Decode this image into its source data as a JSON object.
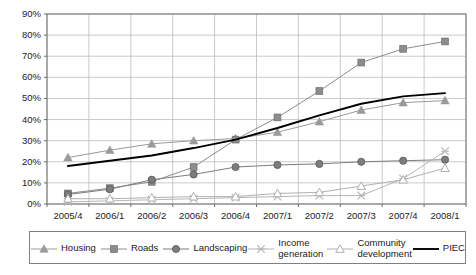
{
  "chart_data": {
    "type": "line",
    "title": "",
    "subtitle": "",
    "xlabel": "",
    "ylabel": "",
    "grid": true,
    "legend_position": "bottom",
    "ylim": [
      0,
      90
    ],
    "y_tick_labels": [
      "90%",
      "80%",
      "70%",
      "60%",
      "50%",
      "40%",
      "30%",
      "20%",
      "10%",
      "0%"
    ],
    "y_tick_values": [
      90,
      80,
      70,
      60,
      50,
      40,
      30,
      20,
      10,
      0
    ],
    "categories": [
      "2005/4",
      "2006/1",
      "2006/2",
      "2006/3",
      "2006/4",
      "2007/1",
      "2007/2",
      "2007/3",
      "2007/4",
      "2008/1"
    ],
    "series": [
      {
        "name": "Housing",
        "marker": "filled-triangle",
        "color": "#9a9a9a",
        "values": [
          22,
          25.5,
          28.5,
          30,
          31,
          34,
          39,
          44.5,
          48,
          49
        ]
      },
      {
        "name": "Roads",
        "marker": "filled-square",
        "color": "#8c8c8c",
        "values": [
          5,
          7.5,
          10.5,
          17.5,
          30.5,
          41,
          53.5,
          67,
          73.5,
          77
        ]
      },
      {
        "name": "Landscaping",
        "marker": "filled-circle",
        "color": "#7d7d7d",
        "values": [
          4.5,
          7,
          11.5,
          14,
          17.5,
          18.5,
          19,
          20,
          20.5,
          21
        ]
      },
      {
        "name": "Income generation",
        "marker": "cross-star",
        "color": "#b5b5b5",
        "values": [
          1,
          1.5,
          2,
          2.5,
          3,
          3.5,
          4,
          4,
          12,
          25
        ]
      },
      {
        "name": "Community development",
        "marker": "open-triangle",
        "color": "#b0b0b0",
        "values": [
          2.5,
          2.5,
          3,
          3.5,
          3.5,
          5,
          5.5,
          8.5,
          11.5,
          17
        ]
      },
      {
        "name": "PIEC",
        "marker": "none",
        "color": "#000000",
        "values": [
          18,
          20.5,
          23,
          26.5,
          30.5,
          36,
          42,
          47.5,
          51,
          52.5
        ]
      }
    ]
  },
  "legend": {
    "items": [
      {
        "label": "Housing",
        "marker_name": "filled-triangle-marker"
      },
      {
        "label": "Roads",
        "marker_name": "filled-square-marker"
      },
      {
        "label": "Landscaping",
        "marker_name": "filled-circle-marker"
      },
      {
        "label": "Income\ngeneration",
        "marker_name": "cross-star-marker"
      },
      {
        "label": "Community\ndevelopment",
        "marker_name": "open-triangle-marker"
      },
      {
        "label": "PIEC",
        "marker_name": "solid-line-marker"
      }
    ]
  }
}
